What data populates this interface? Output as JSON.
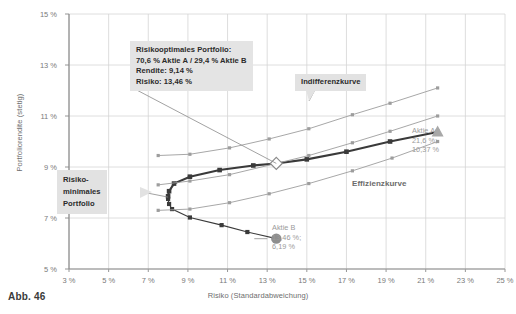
{
  "figure": {
    "caption": "Abb. 46",
    "xlabel": "Risiko (Standardabweichung)",
    "ylabel": "Portfoliorendite (stetig)"
  },
  "annotations": {
    "optimal_portfolio": "Risikooptimales Portfolio:\n70,6 % Aktie A / 29,4 % Aktie B\nRendite: 9,14 %\nRisiko: 13,46 %",
    "min_variance": "Risiko-\nminimales\nPortfolio",
    "indifference_curve": "Indifferenzkurve",
    "efficient_frontier": "Effizienzkurve",
    "aktie_a": "Aktie A\n21,6 %;\n10,37 %",
    "aktie_b": "Aktie B\n13,46 %;\n6,19 %"
  },
  "colors": {
    "frontier": "#3a3a3a",
    "indifference": "#9d9d9d",
    "grid": "#d6d6d6",
    "axis": "#8a8a8a",
    "marker_a": "#a8a8a8",
    "marker_b": "#8e8e8e",
    "callout_bg": "#e2e2e2",
    "text": "#6e6e6e"
  },
  "chart_data": {
    "type": "line",
    "title": "",
    "xlabel": "Risiko (Standardabweichung)",
    "ylabel": "Portfoliorendite (stetig)",
    "xlim": [
      3,
      25
    ],
    "ylim": [
      5,
      15
    ],
    "xticks": [
      "3 %",
      "5 %",
      "7 %",
      "9 %",
      "11 %",
      "13 %",
      "15 %",
      "17 %",
      "19 %",
      "21 %",
      "23 %",
      "25 %"
    ],
    "yticks": [
      "5 %",
      "7 %",
      "9 %",
      "11 %",
      "13 %",
      "15 %"
    ],
    "grid": true,
    "legend": "none",
    "series": [
      {
        "name": "Effizienzkurve (efficient frontier, upper branch)",
        "style": "dark-thick-line-square-markers",
        "color": "#3a3a3a",
        "points": [
          {
            "x": 8.0,
            "y": 7.85
          },
          {
            "x": 8.05,
            "y": 8.05
          },
          {
            "x": 8.3,
            "y": 8.35
          },
          {
            "x": 9.1,
            "y": 8.62
          },
          {
            "x": 10.6,
            "y": 8.88
          },
          {
            "x": 12.3,
            "y": 9.06
          },
          {
            "x": 13.46,
            "y": 9.14
          },
          {
            "x": 15.0,
            "y": 9.3
          },
          {
            "x": 17.0,
            "y": 9.6
          },
          {
            "x": 19.2,
            "y": 10.0
          },
          {
            "x": 21.6,
            "y": 10.37
          }
        ]
      },
      {
        "name": "Portfoliolinie (lower / inefficient branch)",
        "style": "dark-line-square-markers",
        "color": "#3a3a3a",
        "points": [
          {
            "x": 8.0,
            "y": 7.75
          },
          {
            "x": 8.05,
            "y": 7.55
          },
          {
            "x": 8.2,
            "y": 7.35
          },
          {
            "x": 9.1,
            "y": 7.02
          },
          {
            "x": 10.7,
            "y": 6.72
          },
          {
            "x": 12.0,
            "y": 6.45
          },
          {
            "x": 13.46,
            "y": 6.19
          }
        ]
      },
      {
        "name": "Indifferenzkurve 1 (upper)",
        "style": "gray-line-square-markers",
        "color": "#9d9d9d",
        "points": [
          {
            "x": 7.5,
            "y": 9.45
          },
          {
            "x": 9.1,
            "y": 9.5
          },
          {
            "x": 11.1,
            "y": 9.75
          },
          {
            "x": 13.1,
            "y": 10.1
          },
          {
            "x": 15.1,
            "y": 10.5
          },
          {
            "x": 17.3,
            "y": 11.05
          },
          {
            "x": 19.2,
            "y": 11.5
          },
          {
            "x": 21.6,
            "y": 12.1
          }
        ]
      },
      {
        "name": "Indifferenzkurve 2 (middle, tangent at optimum)",
        "style": "gray-line-square-markers",
        "color": "#9d9d9d",
        "points": [
          {
            "x": 7.5,
            "y": 8.3
          },
          {
            "x": 9.1,
            "y": 8.45
          },
          {
            "x": 11.1,
            "y": 8.7
          },
          {
            "x": 13.46,
            "y": 9.14
          },
          {
            "x": 15.1,
            "y": 9.45
          },
          {
            "x": 17.3,
            "y": 9.95
          },
          {
            "x": 19.2,
            "y": 10.4
          },
          {
            "x": 21.6,
            "y": 11.0
          }
        ]
      },
      {
        "name": "Indifferenzkurve 3 (lower)",
        "style": "gray-line-square-markers",
        "color": "#9d9d9d",
        "points": [
          {
            "x": 7.5,
            "y": 7.3
          },
          {
            "x": 9.1,
            "y": 7.35
          },
          {
            "x": 11.1,
            "y": 7.6
          },
          {
            "x": 13.1,
            "y": 7.95
          },
          {
            "x": 15.1,
            "y": 8.35
          },
          {
            "x": 17.3,
            "y": 8.85
          },
          {
            "x": 19.3,
            "y": 9.35
          },
          {
            "x": 21.6,
            "y": 10.0
          }
        ]
      }
    ],
    "markers": [
      {
        "name": "Risikooptimales Portfolio",
        "shape": "diamond",
        "x": 13.46,
        "y": 9.14,
        "label": "Rendite: 9,14 %, Risiko: 13,46 %"
      },
      {
        "name": "Aktie A",
        "shape": "triangle",
        "x": 21.6,
        "y": 10.37,
        "label": "21,6 %; 10,37 %"
      },
      {
        "name": "Aktie B",
        "shape": "circle",
        "x": 13.46,
        "y": 6.19,
        "label": "13,46 %; 6,19 %"
      }
    ]
  }
}
